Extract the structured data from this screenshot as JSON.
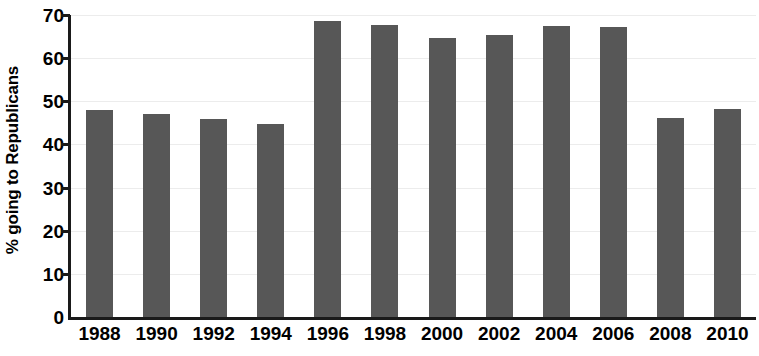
{
  "chart_data": {
    "type": "bar",
    "title": "",
    "subtitle": "",
    "xlabel": "",
    "ylabel": "% going to Republicans",
    "categories": [
      "1988",
      "1990",
      "1992",
      "1994",
      "1996",
      "1998",
      "2000",
      "2002",
      "2004",
      "2006",
      "2008",
      "2010"
    ],
    "values": [
      48.0,
      47.0,
      45.9,
      44.8,
      68.7,
      67.7,
      64.6,
      65.4,
      67.4,
      67.2,
      46.2,
      48.2
    ],
    "series": [
      {
        "name": "% going to Republicans",
        "values": [
          48.0,
          47.0,
          45.9,
          44.8,
          68.7,
          67.7,
          64.6,
          65.4,
          67.4,
          67.2,
          46.2,
          48.2
        ]
      }
    ],
    "ylim": [
      0,
      70
    ],
    "yticks": [
      0,
      10,
      20,
      30,
      40,
      50,
      60,
      70
    ],
    "ytick_labels": [
      "0",
      "10",
      "20",
      "30",
      "40",
      "50",
      "60",
      "70"
    ],
    "xtick_labels": [
      "1988",
      "1990",
      "1992",
      "1994",
      "1996",
      "1998",
      "2000",
      "2002",
      "2004",
      "2006",
      "2008",
      "2010"
    ],
    "grid": true,
    "grid_axis": "y",
    "legend": false,
    "legend_position": "none",
    "bar_color": "#575757",
    "axis_color": "#1a1a1a",
    "gridline_color": "#ececec",
    "background_color": "#ffffff",
    "annotations": []
  },
  "axis": {
    "y_title": "% going to Republicans"
  }
}
